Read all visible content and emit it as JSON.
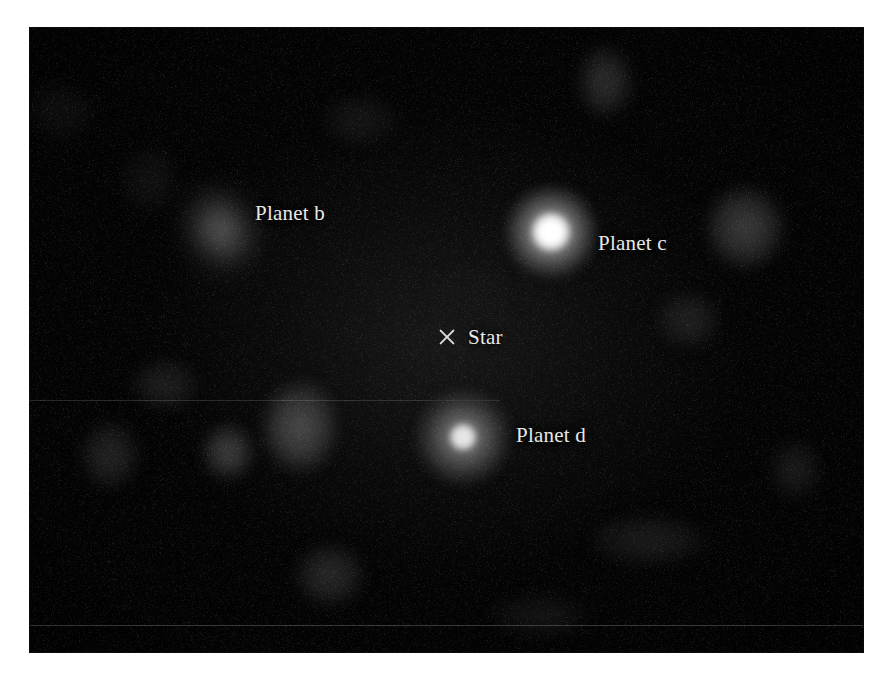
{
  "figure": {
    "kind": "astronomical-image",
    "background_color": "#ffffff",
    "frame": {
      "x": 30,
      "y": 28,
      "width": 833,
      "height": 624,
      "background_color": "#000000"
    }
  },
  "labels": {
    "planet_b": "Planet b",
    "planet_c": "Planet c",
    "planet_d": "Planet d",
    "star": "Star"
  },
  "label_positions": {
    "planet_b": {
      "x": 255,
      "y": 203
    },
    "planet_c": {
      "x": 598,
      "y": 233
    },
    "planet_d": {
      "x": 516,
      "y": 425
    },
    "star": {
      "x": 468,
      "y": 327
    }
  },
  "markers": {
    "star_marker_icon": "x-cross-icon",
    "star_marker_position": {
      "x": 447,
      "y": 337
    },
    "star_marker_color": "#dcdcda"
  },
  "sources": [
    {
      "name": "Planet b",
      "type": "diffuse-faint-source",
      "center": {
        "x": 221,
        "y": 230
      },
      "core_radius": 0,
      "halo_radius": 55,
      "peak_color": "#4a4a4a",
      "relative_brightness": 0.25,
      "shape": "elongated"
    },
    {
      "name": "Planet c",
      "type": "bright-point-source",
      "center": {
        "x": 551,
        "y": 232
      },
      "core_radius": 19,
      "halo_radius": 46,
      "peak_color": "#ffffff",
      "relative_brightness": 1.0,
      "shape": "round"
    },
    {
      "name": "Planet d",
      "type": "point-source",
      "center": {
        "x": 463,
        "y": 437
      },
      "core_radius": 13,
      "halo_radius": 48,
      "peak_color": "#e6e6e6",
      "relative_brightness": 0.72,
      "shape": "round"
    }
  ],
  "speckles": [
    {
      "x": 300,
      "y": 427,
      "rx": 38,
      "ry": 46,
      "brightness": 0.3
    },
    {
      "x": 228,
      "y": 452,
      "rx": 26,
      "ry": 28,
      "brightness": 0.26
    },
    {
      "x": 165,
      "y": 385,
      "rx": 34,
      "ry": 26,
      "brightness": 0.12
    },
    {
      "x": 110,
      "y": 455,
      "rx": 30,
      "ry": 34,
      "brightness": 0.14
    },
    {
      "x": 745,
      "y": 228,
      "rx": 40,
      "ry": 42,
      "brightness": 0.24
    },
    {
      "x": 688,
      "y": 320,
      "rx": 32,
      "ry": 28,
      "brightness": 0.13
    },
    {
      "x": 605,
      "y": 82,
      "rx": 28,
      "ry": 36,
      "brightness": 0.18
    },
    {
      "x": 360,
      "y": 120,
      "rx": 40,
      "ry": 26,
      "brightness": 0.08
    },
    {
      "x": 330,
      "y": 575,
      "rx": 36,
      "ry": 32,
      "brightness": 0.16
    },
    {
      "x": 648,
      "y": 540,
      "rx": 60,
      "ry": 26,
      "brightness": 0.1
    },
    {
      "x": 795,
      "y": 470,
      "rx": 26,
      "ry": 30,
      "brightness": 0.1
    },
    {
      "x": 468,
      "y": 300,
      "rx": 44,
      "ry": 34,
      "brightness": 0.07
    },
    {
      "x": 150,
      "y": 180,
      "rx": 30,
      "ry": 34,
      "brightness": 0.06
    },
    {
      "x": 540,
      "y": 615,
      "rx": 50,
      "ry": 22,
      "brightness": 0.07
    },
    {
      "x": 60,
      "y": 110,
      "rx": 34,
      "ry": 30,
      "brightness": 0.05
    }
  ],
  "artifacts": {
    "scanlines": [
      {
        "y": 400,
        "x": 30,
        "width": 470,
        "intensity": 0.2
      },
      {
        "y": 625,
        "x": 30,
        "width": 833,
        "intensity": 0.28
      }
    ]
  }
}
